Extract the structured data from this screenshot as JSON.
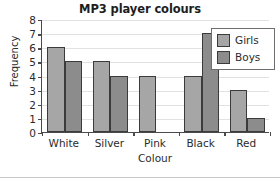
{
  "chart_data": {
    "type": "bar",
    "title": "MP3 player colours",
    "xlabel": "Colour",
    "ylabel": "Frequency",
    "categories": [
      "White",
      "Silver",
      "Pink",
      "Black",
      "Red"
    ],
    "series": [
      {
        "name": "Girls",
        "values": [
          6,
          5,
          4,
          4,
          3
        ],
        "color": "#a6a6a6"
      },
      {
        "name": "Boys",
        "values": [
          5,
          4,
          0,
          7,
          1
        ],
        "color": "#8c8c8c"
      }
    ],
    "ylim": [
      0,
      8
    ],
    "yticks": [
      0,
      1,
      2,
      3,
      4,
      5,
      6,
      7,
      8
    ],
    "ytick_labels": [
      "0",
      "1",
      "2",
      "3",
      "4",
      "5",
      "6",
      "7",
      "8"
    ],
    "grid": true,
    "legend_position": "top-right",
    "bar_outline_color": "#3b3b3b"
  },
  "legend": {
    "entries": [
      {
        "label": "Girls"
      },
      {
        "label": "Boys"
      }
    ]
  }
}
